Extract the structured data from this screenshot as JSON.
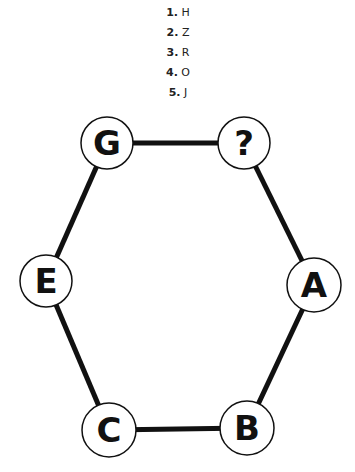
{
  "options": [
    {
      "num": "1.",
      "value": "H"
    },
    {
      "num": "2.",
      "value": "Z"
    },
    {
      "num": "3.",
      "value": "R"
    },
    {
      "num": "4.",
      "value": "O"
    },
    {
      "num": "5.",
      "value": "J"
    }
  ],
  "diagram": {
    "nodes": [
      {
        "id": "G",
        "label": "G",
        "cx": 107,
        "cy": 143
      },
      {
        "id": "unknown",
        "label": "?",
        "cx": 244,
        "cy": 143
      },
      {
        "id": "A",
        "label": "A",
        "cx": 314,
        "cy": 285
      },
      {
        "id": "B",
        "label": "B",
        "cx": 247,
        "cy": 428
      },
      {
        "id": "C",
        "label": "C",
        "cx": 109,
        "cy": 430
      },
      {
        "id": "E",
        "label": "E",
        "cx": 46,
        "cy": 281
      }
    ],
    "edges": [
      [
        "G",
        "unknown"
      ],
      [
        "unknown",
        "A"
      ],
      [
        "A",
        "B"
      ],
      [
        "B",
        "C"
      ],
      [
        "C",
        "E"
      ],
      [
        "E",
        "G"
      ]
    ],
    "colors": {
      "line": "#111111",
      "circle_fill": "#ffffff",
      "circle_stroke": "#111111"
    }
  }
}
